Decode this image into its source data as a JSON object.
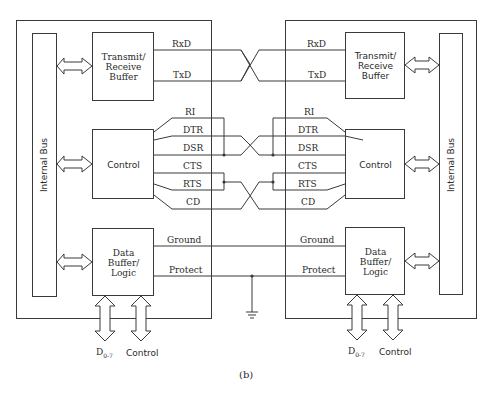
{
  "figure_label": "(b)",
  "left_device": {
    "bus_label": "Internal Bus",
    "tr_buffer": "Transmit/ Receive Buffer",
    "tr_buffer_lines": [
      "Transmit/",
      "Receive",
      "Buffer"
    ],
    "control": "Control",
    "data_buffer_lines": [
      "Data",
      "Buffer/",
      "Logic"
    ],
    "bottom_ports": [
      "D0-7",
      "Control"
    ],
    "signals": [
      "RxD",
      "TxD",
      "RI",
      "DTR",
      "DSR",
      "CTS",
      "RTS",
      "CD",
      "Ground",
      "Protect"
    ]
  },
  "right_device": {
    "bus_label": "Internal Bus",
    "tr_buffer_lines": [
      "Transmit/",
      "Receive",
      "Buffer"
    ],
    "control": "Control",
    "data_buffer_lines": [
      "Data",
      "Buffer/",
      "Logic"
    ],
    "bottom_ports": [
      "D0-7",
      "Control"
    ],
    "signals": [
      "RxD",
      "TxD",
      "RI",
      "DTR",
      "DSR",
      "CTS",
      "RTS",
      "CD",
      "Ground",
      "Protect"
    ]
  },
  "d_port": {
    "base": "D",
    "sub": "0-7"
  },
  "colors": {
    "line": "#3a3a3a",
    "text": "#2a2a2a",
    "background": "#ffffff"
  }
}
